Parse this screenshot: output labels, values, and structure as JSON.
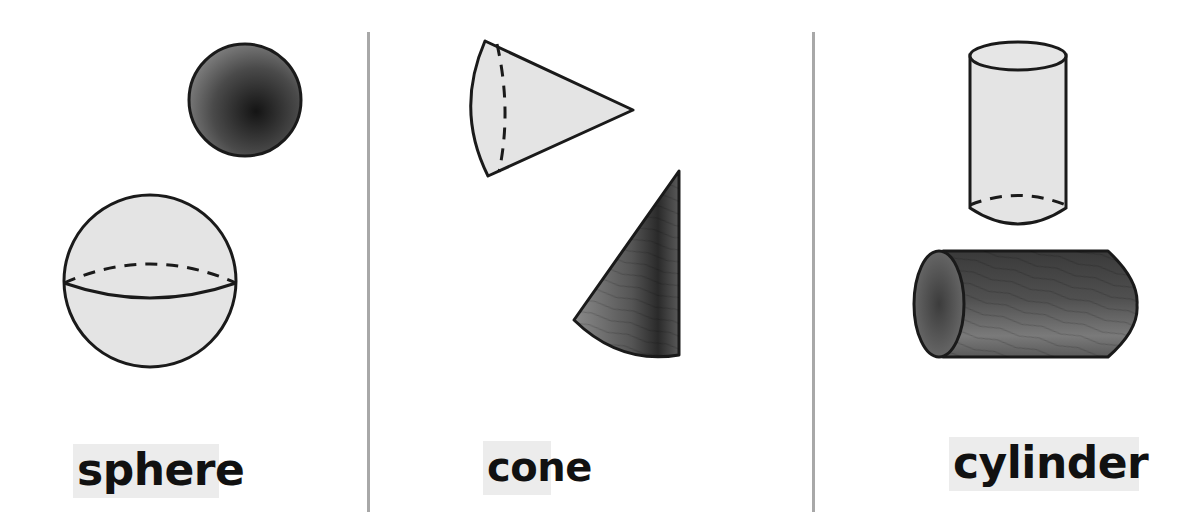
{
  "figure": {
    "columns": [
      {
        "id": "sphere",
        "label": "sphere",
        "wireframe": "sphere with dashed hidden equator",
        "solid_example": "dark shaded ball"
      },
      {
        "id": "cone",
        "label": "cone",
        "wireframe": "cone lying on its side with dashed hidden base edge",
        "solid_example": "dark wood-textured upright cone"
      },
      {
        "id": "cylinder",
        "label": "cylinder",
        "wireframe": "upright cylinder with dashed hidden bottom edge",
        "solid_example": "dark wood-textured cylinder lying horizontally"
      }
    ]
  },
  "colors": {
    "background": "#ffffff",
    "divider": "#a8a8a8",
    "wireframe_fill": "#e4e4e4",
    "outline": "#1a1a1a",
    "solid_dark": "#2a2a2a",
    "solid_mid": "#6a6a6a",
    "label_bg": "#ececec",
    "label_text": "#111111"
  }
}
